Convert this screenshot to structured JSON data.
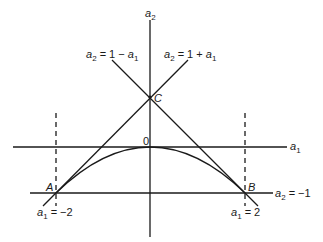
{
  "diagram": {
    "type": "stability-triangle",
    "axes": {
      "horizontal": {
        "label": "a",
        "sub": "1"
      },
      "vertical": {
        "label": "a",
        "sub": "2"
      },
      "origin_label": "0"
    },
    "lines": {
      "left_diag": {
        "lhs": "a",
        "lhs_sub": "2",
        "rhs": " = 1 − ",
        "var": "a",
        "var_sub": "1"
      },
      "right_diag": {
        "lhs": "a",
        "lhs_sub": "2",
        "rhs": " = 1 + ",
        "var": "a",
        "var_sub": "1"
      },
      "bottom": {
        "lhs": "a",
        "lhs_sub": "2",
        "rhs": " = −1"
      },
      "left_dashed": {
        "lhs": "a",
        "lhs_sub": "1",
        "rhs": " = −2"
      },
      "right_dashed": {
        "lhs": "a",
        "lhs_sub": "1",
        "rhs": " = 2"
      }
    },
    "points": {
      "A": "A",
      "B": "B",
      "C": "C"
    },
    "colors": {
      "stroke": "#1a1a1a",
      "background": "#ffffff"
    }
  }
}
